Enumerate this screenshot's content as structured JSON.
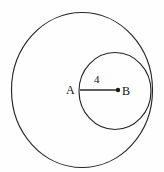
{
  "figure": {
    "background_color": "#fefefe",
    "stroke_color": "#262626",
    "width": 164,
    "height": 172,
    "shapes": {
      "outer_circle": {
        "name": "large-circle",
        "center_x": 82,
        "center_y": 90,
        "radius": 70.5,
        "radius_y": 77.5,
        "fill": "none",
        "stroke": "#262626"
      },
      "inner_circle": {
        "name": "small-circle",
        "center_x": 115,
        "center_y": 91,
        "radius": 36,
        "radius_y": 38.5,
        "fill": "none",
        "stroke": "#262626"
      },
      "segment": {
        "name": "radius-segment-ab",
        "x1": 80,
        "y1": 90,
        "x2": 118,
        "y2": 90,
        "stroke": "#2b2b2b"
      },
      "point_b_dot": {
        "cx": 118,
        "cy": 90,
        "r": 2.2,
        "fill": "#1a1a1a"
      }
    },
    "labels": {
      "point_a": "A",
      "point_b": "B",
      "segment_length": "4"
    }
  }
}
